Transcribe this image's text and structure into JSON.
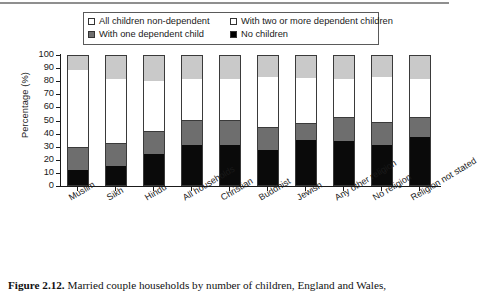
{
  "figure": {
    "caption_label": "Figure 2.12.",
    "caption_text": " Married couple households by number of children, England and Wales,"
  },
  "legend": {
    "items": [
      {
        "id": "all-non-dependent",
        "label": "All children non-dependent",
        "swatch": "white-outline",
        "color": "#ffffff"
      },
      {
        "id": "two-or-more-dependent",
        "label": "With two or more dependent children",
        "swatch": "white-outline",
        "color": "#ffffff"
      },
      {
        "id": "one-dependent",
        "label": "With one dependent child",
        "swatch": "gray-filled",
        "color": "#6e6e6e"
      },
      {
        "id": "no-children",
        "label": "No children",
        "swatch": "black-filled",
        "color": "#000000"
      }
    ]
  },
  "chart_data": {
    "type": "bar",
    "subtype": "stacked-percentage",
    "title": "",
    "xlabel": "",
    "ylabel": "Percentage (%)",
    "ylim": [
      0,
      100
    ],
    "yticks": [
      0,
      10,
      20,
      30,
      40,
      50,
      60,
      70,
      80,
      90,
      100
    ],
    "ytick_labels": [
      "0",
      "10",
      "20",
      "30",
      "40",
      "50",
      "60",
      "70",
      "80",
      "90",
      "100"
    ],
    "grid": false,
    "legend_position": "top",
    "categories": [
      "Muslim",
      "Sikh",
      "Hindu",
      "All households",
      "Christian",
      "Buddhist",
      "Jewish",
      "Any other religion",
      "No religion",
      "Religion not stated"
    ],
    "series": [
      {
        "name": "No children",
        "color": "#0a0a0a",
        "values": [
          12,
          15,
          24,
          31,
          31,
          27,
          35,
          34,
          31,
          37
        ]
      },
      {
        "name": "With one dependent child",
        "color": "#6e6e6e",
        "values": [
          17,
          17,
          17,
          19,
          19,
          17,
          12,
          18,
          17,
          15
        ]
      },
      {
        "name": "With two or more dependent children",
        "color": "#ffffff",
        "values": [
          60,
          50,
          40,
          32,
          32,
          40,
          36,
          30,
          36,
          30
        ]
      },
      {
        "name": "All children non-dependent",
        "color": "#c9c9c9",
        "values": [
          11,
          18,
          19,
          18,
          18,
          16,
          17,
          18,
          16,
          18
        ]
      }
    ]
  }
}
